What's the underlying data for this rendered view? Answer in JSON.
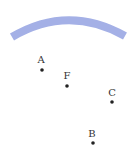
{
  "diagram": {
    "arc": {
      "color": "#a4b0e6",
      "stroke_width": 8
    },
    "points": [
      {
        "label": "A",
        "x": 42,
        "y": 70,
        "lx": 41,
        "ly": 63
      },
      {
        "label": "F",
        "x": 67,
        "y": 86,
        "lx": 67,
        "ly": 79
      },
      {
        "label": "C",
        "x": 112,
        "y": 102,
        "lx": 112,
        "ly": 96
      },
      {
        "label": "B",
        "x": 93,
        "y": 143,
        "lx": 92,
        "ly": 137
      }
    ]
  }
}
